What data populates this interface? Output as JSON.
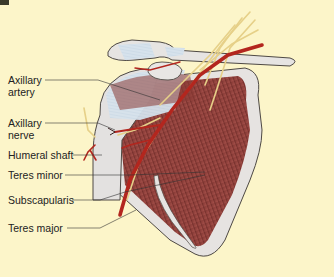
{
  "figure": {
    "background_color": "#fcf5c9",
    "colors": {
      "bone": "#e3e1e0",
      "bone_outline": "#5a5550",
      "cartilage": "#cfdde9",
      "muscle": "#9a4a45",
      "muscle_dark": "#6e2a28",
      "artery": "#b3261e",
      "nerve": "#e8d48a"
    }
  },
  "labels": [
    {
      "id": "axillary-artery",
      "line1": "Axillary",
      "line2": "artery"
    },
    {
      "id": "axillary-nerve",
      "line1": "Axillary",
      "line2": "nerve"
    },
    {
      "id": "humeral-shaft",
      "line1": "Humeral shaft"
    },
    {
      "id": "teres-minor",
      "line1": "Teres minor"
    },
    {
      "id": "subscapularis",
      "line1": "Subscapularis"
    },
    {
      "id": "teres-major",
      "line1": "Teres major"
    }
  ]
}
